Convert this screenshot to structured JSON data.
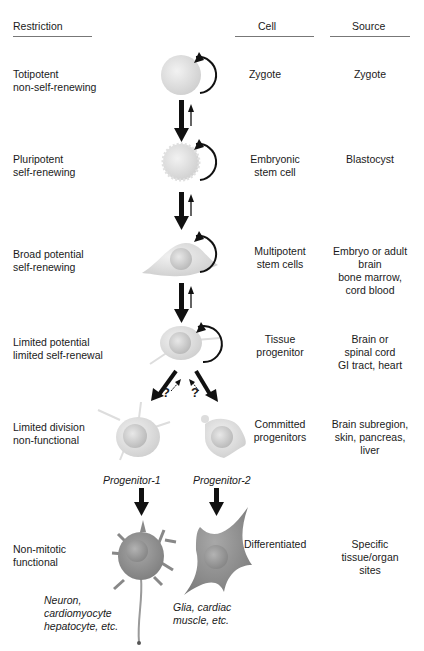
{
  "headers": {
    "restriction": "Restriction",
    "cell": "Cell",
    "source": "Source"
  },
  "rows": [
    {
      "restriction": [
        "Totipotent",
        "non-self-renewing"
      ],
      "cell": [
        "Zygote"
      ],
      "source": [
        "Zygote"
      ]
    },
    {
      "restriction": [
        "Pluripotent",
        "self-renewing"
      ],
      "cell": [
        "Embryonic",
        "stem cell"
      ],
      "source": [
        "Blastocyst"
      ]
    },
    {
      "restriction": [
        "Broad potential",
        "self-renewing"
      ],
      "cell": [
        "Multipotent",
        "stem cells"
      ],
      "source": [
        "Embryo or adult",
        "brain",
        "bone marrow,",
        "cord blood"
      ]
    },
    {
      "restriction": [
        "Limited potential",
        "limited self-renewal"
      ],
      "cell": [
        "Tissue",
        "progenitor"
      ],
      "source": [
        "Brain or",
        "spinal cord",
        "GI tract, heart"
      ]
    },
    {
      "restriction": [
        "Limited division",
        "non-functional"
      ],
      "cell": [
        "Committed",
        "progenitors"
      ],
      "source": [
        "Brain subregion,",
        "skin, pancreas,",
        "liver"
      ]
    },
    {
      "restriction": [
        "Non-mitotic",
        "functional"
      ],
      "cell": [
        "Differentiated"
      ],
      "source": [
        "Specific",
        "tissue/organ",
        "sites"
      ]
    }
  ],
  "branch_labels": {
    "progenitor_1": "Progenitor-1",
    "progenitor_2": "Progenitor-2",
    "question_mark": "?"
  },
  "outcomes": {
    "left": [
      "Neuron,",
      "cardiomyocyte",
      "hepatocyte, etc."
    ],
    "right": [
      "Glia, cardiac",
      "muscle, etc."
    ]
  },
  "colors": {
    "text": "#1a1a1a",
    "rule": "#777777",
    "arrow": "#111111",
    "cell_light": "#e4e4e4",
    "cell_dark": "#8f8f8f"
  }
}
